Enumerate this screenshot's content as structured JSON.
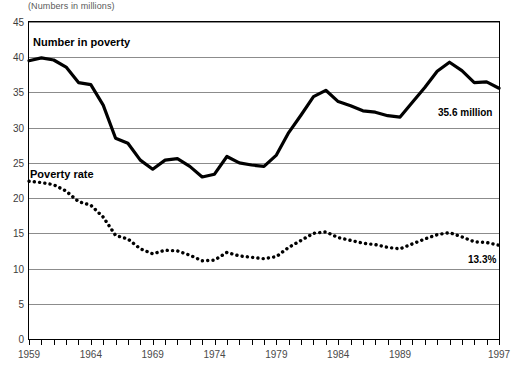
{
  "chart_data": {
    "type": "line",
    "title": "",
    "subtitle": "(Numbers in millions)",
    "xlabel": "",
    "ylabel": "",
    "ylim": [
      0,
      45
    ],
    "ytick_values": [
      0,
      5,
      10,
      15,
      20,
      25,
      30,
      35,
      40,
      45
    ],
    "ytick_labels": [
      "0",
      "5",
      "10",
      "15",
      "20",
      "25",
      "30",
      "35",
      "40",
      "45"
    ],
    "grid": "horizontal",
    "legend_position": "inline-annotations",
    "xlim": [
      1959,
      1997
    ],
    "x": [
      1959,
      1960,
      1961,
      1962,
      1963,
      1964,
      1965,
      1966,
      1967,
      1968,
      1969,
      1970,
      1971,
      1972,
      1973,
      1974,
      1975,
      1976,
      1977,
      1978,
      1979,
      1980,
      1981,
      1982,
      1983,
      1984,
      1985,
      1986,
      1987,
      1988,
      1989,
      1990,
      1991,
      1992,
      1993,
      1994,
      1995,
      1996,
      1997
    ],
    "xtick_labels": [
      "1959",
      "1964",
      "1969",
      "1974",
      "1979",
      "1984",
      "1989",
      "1997"
    ],
    "xtick_label_years": [
      1959,
      1964,
      1969,
      1974,
      1979,
      1984,
      1989,
      1997
    ],
    "series": [
      {
        "name": "Number in poverty",
        "units": "millions",
        "style": "solid-thick",
        "color": "#000000",
        "values": [
          39.5,
          39.9,
          39.6,
          38.6,
          36.4,
          36.1,
          33.2,
          28.5,
          27.8,
          25.4,
          24.1,
          25.4,
          25.6,
          24.5,
          23.0,
          23.4,
          25.9,
          25.0,
          24.7,
          24.5,
          26.1,
          29.3,
          31.8,
          34.4,
          35.3,
          33.7,
          33.1,
          32.4,
          32.2,
          31.7,
          31.5,
          33.6,
          35.7,
          38.0,
          39.3,
          38.1,
          36.4,
          36.5,
          35.6
        ]
      },
      {
        "name": "Poverty rate",
        "units": "percent",
        "style": "dotted",
        "color": "#000000",
        "values": [
          22.4,
          22.2,
          21.9,
          21.0,
          19.5,
          19.0,
          17.3,
          14.7,
          14.2,
          12.8,
          12.1,
          12.6,
          12.5,
          11.9,
          11.1,
          11.2,
          12.3,
          11.8,
          11.6,
          11.4,
          11.7,
          13.0,
          14.0,
          15.0,
          15.2,
          14.4,
          14.0,
          13.6,
          13.4,
          13.0,
          12.8,
          13.5,
          14.2,
          14.8,
          15.1,
          14.5,
          13.8,
          13.7,
          13.3
        ]
      }
    ],
    "annotations": [
      {
        "name": "number-in-poverty-label",
        "text": "Number in poverty"
      },
      {
        "name": "poverty-rate-label",
        "text": "Poverty rate"
      },
      {
        "name": "number-in-poverty-endpoint",
        "text": "35.6 million"
      },
      {
        "name": "poverty-rate-endpoint",
        "text": "13.3%"
      }
    ]
  },
  "figure": {
    "unit_note": "(Numbers in millions)",
    "series_labels": {
      "number_in_poverty": "Number in poverty",
      "poverty_rate": "Poverty rate"
    },
    "callouts": {
      "number_in_poverty": "35.6 million",
      "poverty_rate": "13.3%"
    },
    "colors": {
      "plot_border": "#000000",
      "gridline": "#8c8c8c",
      "series_line": "#000000",
      "background": "#ffffff",
      "tick_text": "#3c3c3c"
    }
  }
}
